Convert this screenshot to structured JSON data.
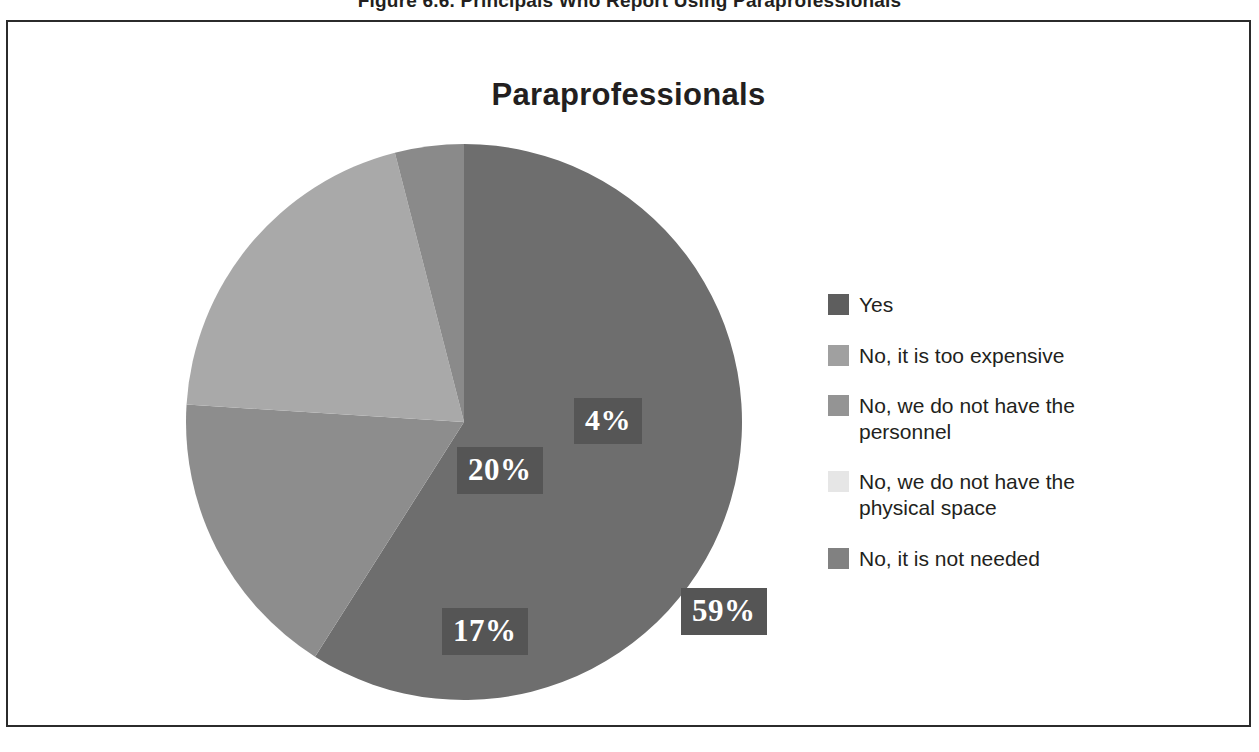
{
  "figure": {
    "caption": "Figure 6.6. Principals Who Report Using Paraprofessionals"
  },
  "chart": {
    "title": "Paraprofessionals"
  },
  "chart_data": {
    "type": "pie",
    "title": "Paraprofessionals",
    "xlabel": "",
    "ylabel": "",
    "grid": false,
    "legend_position": "right",
    "units": "percent",
    "start_angle_deg": 0,
    "direction": "clockwise",
    "categories": [
      "Yes",
      "No, it is too expensive",
      "No, we do not have the personnel",
      "No, we do not have the physical space",
      "No, it is not needed"
    ],
    "values": [
      59,
      20,
      0,
      4,
      17
    ],
    "slices": [
      {
        "label": "Yes",
        "value": 59,
        "display": "59%",
        "color": "#6e6e6e",
        "start_deg": 0,
        "end_deg": 212.4
      },
      {
        "label": "No, it is not needed",
        "value": 17,
        "display": "17%",
        "color": "#8d8d8d",
        "start_deg": 212.4,
        "end_deg": 273.6
      },
      {
        "label": "No, it is too expensive",
        "value": 20,
        "display": "20%",
        "color": "#a9a9a9",
        "start_deg": 273.6,
        "end_deg": 345.6
      },
      {
        "label": "No, we do not have the physical space",
        "value": 4,
        "display": "4%",
        "color": "#8a8a8a",
        "start_deg": 345.6,
        "end_deg": 360
      }
    ],
    "data_labels": [
      "59%",
      "20%",
      "17%",
      "4%"
    ]
  },
  "legend": {
    "items": [
      {
        "label": "Yes",
        "color": "#5e5e5e"
      },
      {
        "label": "No, it is too expensive",
        "color": "#a0a0a0"
      },
      {
        "label": "No, we do not have the personnel",
        "color": "#949494"
      },
      {
        "label": "No, we do not have the physical space",
        "color": "#e6e6e6"
      },
      {
        "label": "No, it is not needed",
        "color": "#818181"
      }
    ]
  },
  "labels": {
    "yes_pct": "59%",
    "too_expensive_pct": "20%",
    "not_needed_pct": "17%",
    "physical_space_pct": "4%"
  },
  "colors": {
    "frame_border": "#2b2b2b",
    "text": "#231f20",
    "label_box_bg": "#555555",
    "label_text": "#ffffff",
    "background": "#ffffff"
  }
}
